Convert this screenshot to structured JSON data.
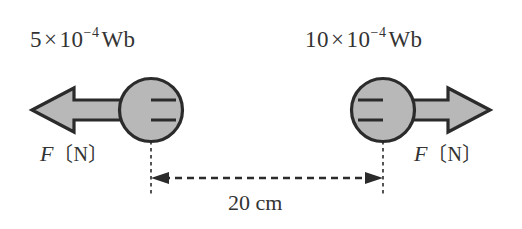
{
  "figure": {
    "type": "physics-force-diagram",
    "background_color": "#ffffff",
    "stroke_color": "#2b2b2b",
    "fill_color": "#b8b8b8"
  },
  "left_pole": {
    "magnetic_flux_label": {
      "coefficient": "5",
      "times": "×",
      "base": "10",
      "exponent": "−4",
      "unit": "Wb",
      "full_text": "5×10⁻⁴Wb"
    },
    "force_label": {
      "symbol": "F",
      "open_bracket": "〔",
      "unit": "N",
      "close_bracket": "〕",
      "full_text": "F〔N〕"
    },
    "arrow_direction": "left"
  },
  "right_pole": {
    "magnetic_flux_label": {
      "coefficient": "10",
      "times": "×",
      "base": "10",
      "exponent": "−4",
      "unit": "Wb",
      "full_text": "10×10⁻⁴Wb"
    },
    "force_label": {
      "symbol": "F",
      "open_bracket": "〔",
      "unit": "N",
      "close_bracket": "〕",
      "full_text": "F〔N〕"
    },
    "arrow_direction": "right"
  },
  "separation": {
    "value": "20",
    "unit": "cm",
    "full_text": "20 cm"
  }
}
